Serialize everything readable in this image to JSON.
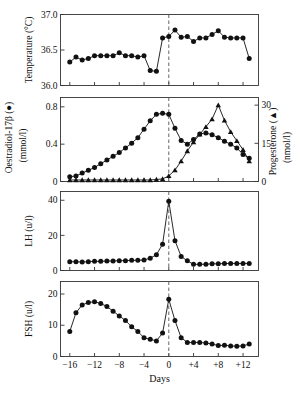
{
  "figure": {
    "x_axis_label": "Days",
    "x_ticks": [
      "−16",
      "−12",
      "−8",
      "−4",
      "0",
      "+4",
      "+8",
      "+12"
    ],
    "x_tick_values": [
      -16,
      -12,
      -8,
      -4,
      0,
      4,
      8,
      12
    ],
    "x_range": [
      -17.5,
      14.5
    ],
    "reference_line_day": 0,
    "reference_line_style": "dashed"
  },
  "panels": {
    "temperature": {
      "axis_title_line1": "Temperature (°C)",
      "y_ticks": [
        "37.0",
        "36.5",
        "36.0"
      ],
      "y_tick_values": [
        37.0,
        36.5,
        36.0
      ]
    },
    "steroids": {
      "left_axis_title_line1": "Oestradiol-17β (●)",
      "left_axis_title_line2": "(mmol/l)",
      "left_y_ticks": [
        "0.8",
        "0.4",
        "0"
      ],
      "left_y_tick_values": [
        0.8,
        0.4,
        0.0
      ],
      "right_axis_title_line1": "Progesterone (▲)",
      "right_axis_title_line2": "(nmol/l)",
      "right_y_ticks": [
        "30",
        "15",
        "0"
      ],
      "right_y_tick_values": [
        30,
        15,
        0
      ]
    },
    "lh": {
      "axis_title_line1": "LH (u/l)",
      "y_ticks": [
        "40",
        "20",
        "0"
      ],
      "y_tick_values": [
        40,
        20,
        0
      ]
    },
    "fsh": {
      "axis_title_line1": "FSH (u/l)",
      "y_ticks": [
        "20",
        "10",
        "0"
      ],
      "y_tick_values": [
        20,
        10,
        0
      ]
    }
  },
  "chart_data": [
    {
      "type": "line",
      "title": "Temperature (°C)",
      "xlabel": "Days",
      "ylabel": "Temperature (°C)",
      "xlim": [
        -17.5,
        14.5
      ],
      "ylim": [
        36.0,
        37.0
      ],
      "grid": false,
      "legend": null,
      "marker": "filled-circle",
      "x": [
        -16,
        -15,
        -14,
        -13,
        -12,
        -11,
        -10,
        -9,
        -8,
        -7,
        -6,
        -5,
        -4,
        -3,
        -2,
        -1,
        0,
        1,
        2,
        3,
        4,
        5,
        6,
        7,
        8,
        9,
        10,
        11,
        12,
        13
      ],
      "values": [
        36.33,
        36.4,
        36.36,
        36.38,
        36.42,
        36.42,
        36.42,
        36.42,
        36.46,
        36.42,
        36.42,
        36.4,
        36.42,
        36.21,
        36.2,
        36.67,
        36.69,
        36.78,
        36.68,
        36.69,
        36.62,
        36.67,
        36.67,
        36.72,
        36.77,
        36.68,
        36.67,
        36.67,
        36.67,
        36.38
      ]
    },
    {
      "type": "line",
      "title": "Oestradiol-17β and Progesterone",
      "xlabel": "Days",
      "xlim": [
        -17.5,
        14.5
      ],
      "grid": false,
      "legend": "inline-axis-titles",
      "series": [
        {
          "name": "Oestradiol-17β (mmol/l)",
          "axis": "left",
          "ylabel": "Oestradiol-17β (mmol/l)",
          "ylim": [
            0,
            0.9
          ],
          "marker": "filled-circle",
          "x": [
            -16,
            -15,
            -14,
            -13,
            -12,
            -11,
            -10,
            -9,
            -8,
            -7,
            -6,
            -5,
            -4,
            -3,
            -2,
            -1,
            0,
            1,
            2,
            3,
            4,
            5,
            6,
            7,
            8,
            9,
            10,
            11,
            12,
            13
          ],
          "values": [
            0.05,
            0.06,
            0.09,
            0.12,
            0.15,
            0.19,
            0.23,
            0.27,
            0.31,
            0.36,
            0.41,
            0.47,
            0.56,
            0.65,
            0.72,
            0.73,
            0.72,
            0.57,
            0.44,
            0.4,
            0.45,
            0.51,
            0.52,
            0.5,
            0.47,
            0.43,
            0.4,
            0.36,
            0.29,
            0.25,
            0.2
          ]
        },
        {
          "name": "Progesterone (nmol/l)",
          "axis": "right",
          "ylabel": "Progesterone (nmol/l)",
          "ylim": [
            0,
            33
          ],
          "marker": "filled-triangle",
          "x": [
            -16,
            -15,
            -14,
            -13,
            -12,
            -11,
            -10,
            -9,
            -8,
            -7,
            -6,
            -5,
            -4,
            -3,
            -2,
            -1,
            0,
            1,
            2,
            3,
            4,
            5,
            6,
            7,
            8,
            9,
            10,
            11,
            12,
            13
          ],
          "values": [
            0.6,
            0.6,
            0.6,
            0.6,
            0.6,
            0.6,
            0.6,
            0.6,
            0.6,
            0.6,
            0.6,
            0.6,
            0.6,
            0.6,
            0.8,
            1.0,
            2.2,
            4.5,
            8.0,
            12.0,
            15.5,
            18.5,
            21.5,
            24.5,
            30.0,
            24.0,
            19.5,
            16.0,
            12.5,
            8.0,
            5.0
          ]
        }
      ]
    },
    {
      "type": "line",
      "title": "LH (u/l)",
      "xlabel": "Days",
      "ylabel": "LH (u/l)",
      "xlim": [
        -17.5,
        14.5
      ],
      "ylim": [
        0,
        45
      ],
      "grid": false,
      "legend": null,
      "marker": "filled-circle",
      "x": [
        -16,
        -15,
        -14,
        -13,
        -12,
        -11,
        -10,
        -9,
        -8,
        -7,
        -6,
        -5,
        -4,
        -3,
        -2,
        -1,
        0,
        1,
        2,
        3,
        4,
        5,
        6,
        7,
        8,
        9,
        10,
        11,
        12,
        13
      ],
      "values": [
        5.0,
        5.0,
        4.8,
        5.0,
        5.2,
        5.2,
        5.4,
        5.4,
        5.6,
        5.6,
        5.8,
        5.8,
        6.0,
        7.0,
        9.0,
        15.0,
        39.5,
        17.0,
        8.0,
        5.5,
        3.5,
        3.5,
        3.6,
        3.8,
        3.8,
        4.0,
        4.0,
        4.0,
        4.0,
        4.0,
        3.8
      ]
    },
    {
      "type": "line",
      "title": "FSH (u/l)",
      "xlabel": "Days",
      "ylabel": "FSH (u/l)",
      "xlim": [
        -17.5,
        14.5
      ],
      "ylim": [
        0,
        24
      ],
      "grid": false,
      "legend": null,
      "marker": "filled-circle",
      "x": [
        -16,
        -15,
        -14,
        -13,
        -12,
        -11,
        -10,
        -9,
        -8,
        -7,
        -6,
        -5,
        -4,
        -3,
        -2,
        -1,
        0,
        1,
        2,
        3,
        4,
        5,
        6,
        7,
        8,
        9,
        10,
        11,
        12,
        13
      ],
      "values": [
        8.0,
        14.0,
        16.5,
        17.3,
        17.5,
        17.0,
        16.0,
        14.5,
        13.0,
        11.5,
        9.5,
        8.0,
        6.0,
        5.5,
        5.0,
        7.5,
        18.3,
        11.5,
        6.0,
        4.5,
        4.5,
        4.5,
        4.3,
        4.0,
        3.5,
        3.6,
        3.4,
        3.3,
        3.4,
        4.0,
        5.2
      ]
    }
  ]
}
